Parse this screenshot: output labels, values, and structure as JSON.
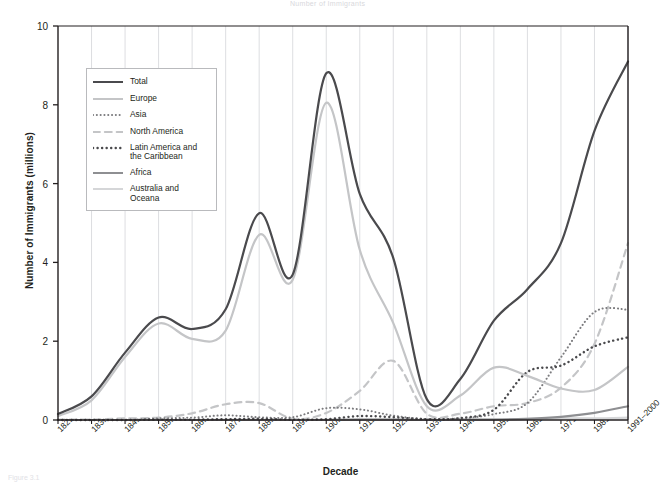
{
  "figure": {
    "top_fragment": "Number of Immigrants",
    "bottom_fragment": "Figure 3.1"
  },
  "chart_data": {
    "type": "line",
    "title": "",
    "xlabel": "Decade",
    "ylabel": "Number of Immigrants (millions)",
    "ylim": [
      0,
      10
    ],
    "yticks": [
      0,
      2,
      4,
      6,
      8,
      10
    ],
    "grid": "vertical",
    "legend_position": "upper-left",
    "categories": [
      "1821–1830",
      "1831–1840",
      "1841–1850",
      "1851–1860",
      "1861–1870",
      "1871–1880",
      "1881–1890",
      "1891–1900",
      "1901–1910",
      "1911–1920",
      "1921–1930",
      "1931–1940",
      "1941–1950",
      "1951–1960",
      "1961–1970",
      "1971–1980",
      "1981–1990",
      "1991–2000"
    ],
    "series": [
      {
        "name": "Total",
        "color": "#4a4a4d",
        "style": "solid",
        "width": 2.2,
        "values": [
          0.15,
          0.6,
          1.71,
          2.6,
          2.31,
          2.81,
          5.25,
          3.69,
          8.8,
          5.74,
          4.11,
          0.53,
          1.04,
          2.52,
          3.32,
          4.49,
          7.34,
          9.1
        ]
      },
      {
        "name": "Europe",
        "color": "#c4c5c7",
        "style": "solid",
        "width": 2.2,
        "values": [
          0.1,
          0.5,
          1.6,
          2.45,
          2.06,
          2.27,
          4.7,
          3.56,
          8.05,
          4.32,
          2.46,
          0.35,
          0.62,
          1.33,
          1.12,
          0.8,
          0.76,
          1.35
        ]
      },
      {
        "name": "Asia",
        "color": "#7b7b7e",
        "style": "dotted",
        "width": 2.0,
        "values": [
          0.0,
          0.0,
          0.0,
          0.04,
          0.06,
          0.12,
          0.07,
          0.07,
          0.3,
          0.27,
          0.11,
          0.02,
          0.04,
          0.15,
          0.43,
          1.59,
          2.74,
          2.8
        ]
      },
      {
        "name": "North America",
        "color": "#c4c5c7",
        "style": "dashed",
        "width": 2.2,
        "values": [
          0.01,
          0.01,
          0.04,
          0.06,
          0.17,
          0.4,
          0.43,
          0.03,
          0.18,
          0.74,
          1.5,
          0.16,
          0.16,
          0.35,
          0.43,
          0.82,
          1.93,
          4.49
        ]
      },
      {
        "name": "Latin America and the Caribbean",
        "color": "#4a4a4d",
        "style": "dotted",
        "width": 2.4,
        "values": [
          0.0,
          0.0,
          0.0,
          0.01,
          0.01,
          0.02,
          0.03,
          0.01,
          0.02,
          0.1,
          0.07,
          0.02,
          0.05,
          0.26,
          1.22,
          1.38,
          1.87,
          2.1
        ]
      },
      {
        "name": "Africa",
        "color": "#8e8f92",
        "style": "solid",
        "width": 2.2,
        "values": [
          0.0,
          0.0,
          0.0,
          0.0,
          0.0,
          0.0,
          0.0,
          0.0,
          0.0,
          0.01,
          0.01,
          0.0,
          0.01,
          0.01,
          0.03,
          0.08,
          0.18,
          0.35
        ]
      },
      {
        "name": "Australia and Oceana",
        "color": "#d5d6d8",
        "style": "solid",
        "width": 2.2,
        "values": [
          0.0,
          0.0,
          0.0,
          0.0,
          0.0,
          0.01,
          0.01,
          0.0,
          0.01,
          0.01,
          0.01,
          0.0,
          0.0,
          0.01,
          0.03,
          0.04,
          0.04,
          0.06
        ]
      }
    ]
  },
  "legend": {
    "items": [
      {
        "label": "Total"
      },
      {
        "label": "Europe"
      },
      {
        "label": "Asia"
      },
      {
        "label": "North America"
      },
      {
        "label": "Latin America and the Caribbean"
      },
      {
        "label": "Africa"
      },
      {
        "label": "Australia and Oceana"
      }
    ]
  }
}
